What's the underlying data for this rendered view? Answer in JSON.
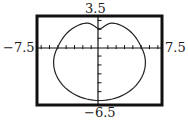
{
  "chart_data": {
    "type": "line",
    "title": "",
    "xlabel": "",
    "ylabel": "",
    "xlim": [
      -7.5,
      7.5
    ],
    "ylim": [
      -6.5,
      3.5
    ],
    "tick_labels": {
      "xmin": "−7.5",
      "xmax": "7.5",
      "ymin": "−6.5",
      "ymax": "3.5"
    },
    "x_tick_step": 1,
    "y_tick_step": 1,
    "grid": false,
    "curve": "polar heart-shaped curve (limaçon-like), dimpled at top",
    "key_points": [
      {
        "x": 0,
        "y": 2.0,
        "note": "top dimple"
      },
      {
        "x": -2.3,
        "y": 2.8,
        "note": "left lobe top"
      },
      {
        "x": 2.3,
        "y": 2.8,
        "note": "right lobe top"
      },
      {
        "x": -5.0,
        "y": 0,
        "note": "left x-intercept"
      },
      {
        "x": 5.0,
        "y": 0,
        "note": "right x-intercept"
      },
      {
        "x": 0,
        "y": -6.0,
        "note": "bottom"
      }
    ]
  },
  "labels": {
    "ymax": "3.5",
    "ymin": "−6.5",
    "xmin": "−7.5",
    "xmax": "7.5"
  }
}
